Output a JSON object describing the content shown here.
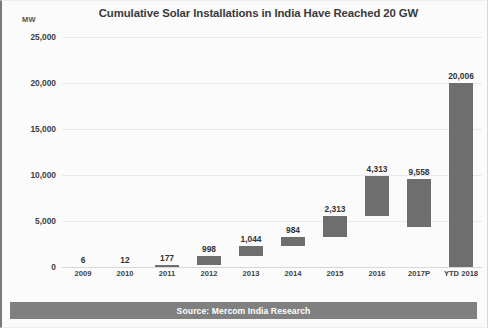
{
  "chart_data": {
    "type": "bar",
    "title": "Cumulative Solar Installations in India Have Reached 20 GW",
    "xlabel": "",
    "ylabel": "MW",
    "ylim": [
      0,
      25000
    ],
    "grid": true,
    "legend": null,
    "style_note": "waterfall-style bars: each bar spans from previous year's cumulative value up to the current year's cumulative value",
    "categories": [
      "2009",
      "2010",
      "2011",
      "2012",
      "2013",
      "2014",
      "2015",
      "2016",
      "2017P",
      "YTD 2018"
    ],
    "values": [
      6,
      12,
      177,
      998,
      1044,
      984,
      2313,
      4313,
      9558,
      20006
    ],
    "value_labels": [
      "6",
      "12",
      "177",
      "998",
      "1,044",
      "984",
      "2,313",
      "4,313",
      "9,558",
      "20,006"
    ],
    "bar_spans": [
      {
        "category": "2009",
        "bottom": 0,
        "top": 6
      },
      {
        "category": "2010",
        "bottom": 6,
        "top": 18
      },
      {
        "category": "2011",
        "bottom": 18,
        "top": 195
      },
      {
        "category": "2012",
        "bottom": 195,
        "top": 1193
      },
      {
        "category": "2013",
        "bottom": 1193,
        "top": 2237
      },
      {
        "category": "2014",
        "bottom": 2237,
        "top": 3221
      },
      {
        "category": "2015",
        "bottom": 3221,
        "top": 5534
      },
      {
        "category": "2016",
        "bottom": 5534,
        "top": 9847
      },
      {
        "category": "2017P",
        "bottom": 4313,
        "top": 9558
      },
      {
        "category": "YTD 2018",
        "bottom": 0,
        "top": 20006
      }
    ],
    "yticks": [
      0,
      5000,
      10000,
      15000,
      20000,
      25000
    ],
    "ytick_labels": [
      "0",
      "5,000",
      "10,000",
      "15,000",
      "20,000",
      "25,000"
    ],
    "colors": {
      "bar": "#6e6e6e",
      "gridline": "#e9e9e9",
      "text": "#3a3a3a",
      "source_bar": "#808080",
      "source_text": "#ffffff",
      "background": "#fbfbfb"
    }
  },
  "footer": {
    "source": "Source: Mercom India Research"
  }
}
